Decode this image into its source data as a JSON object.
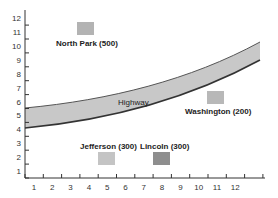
{
  "chart_data": {
    "type": "scatter",
    "title": "",
    "xlabel": "",
    "ylabel": "",
    "x_ticks": [
      "1",
      "2",
      "3",
      "4",
      "5",
      "6",
      "7",
      "8",
      "9",
      "10",
      "11",
      "12"
    ],
    "y_ticks": [
      "1",
      "2",
      "3",
      "4",
      "5",
      "6",
      "7",
      "8",
      "9",
      "10",
      "11",
      "12"
    ],
    "xlim": [
      0,
      13
    ],
    "ylim": [
      0,
      12
    ],
    "road": {
      "label": "Highway",
      "description": "Curved band rising from lower-left to upper-right",
      "lower_edge": [
        [
          0,
          4.3
        ],
        [
          13,
          9.0
        ]
      ],
      "upper_edge": [
        [
          0,
          5.6
        ],
        [
          13,
          10.4
        ]
      ],
      "fill": "#c8c8c8"
    },
    "points": [
      {
        "name": "North Park",
        "value": 500,
        "label": "North Park (500)",
        "x": 4,
        "y": 11,
        "color": "#b3b3b3"
      },
      {
        "name": "Washington",
        "value": 200,
        "label": "Washington (200)",
        "x": 11,
        "y": 6.4,
        "color": "#b8b8b8"
      },
      {
        "name": "Jefferson",
        "value": 300,
        "label": "Jefferson (300)",
        "x": 5,
        "y": 2,
        "color": "#c4c4c4"
      },
      {
        "name": "Lincoln",
        "value": 300,
        "label": "Lincoln (300)",
        "x": 8,
        "y": 2,
        "color": "#8e8e8e"
      }
    ]
  }
}
